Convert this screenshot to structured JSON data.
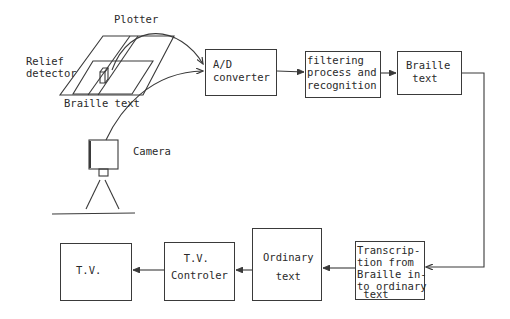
{
  "diagram": {
    "labels": {
      "plotter": "Plotter",
      "relief_detector_1": "Relief",
      "relief_detector_2": "detector",
      "braille_text_sheet": "Braille text",
      "camera": "Camera"
    },
    "nodes": [
      {
        "id": "ad",
        "lines": [
          "A/D",
          "converter"
        ]
      },
      {
        "id": "filter",
        "lines": [
          "filtering",
          "process and",
          "recognition"
        ]
      },
      {
        "id": "braille",
        "lines": [
          "Braille",
          " text"
        ]
      },
      {
        "id": "transcription",
        "lines": [
          "Transcrip-",
          "tion from",
          "Braille in-",
          "to ordinary",
          " text"
        ]
      },
      {
        "id": "ordinary",
        "lines": [
          "Ordinary",
          "  text"
        ]
      },
      {
        "id": "tvctrl",
        "lines": [
          "  T.V.",
          "Controler"
        ]
      },
      {
        "id": "tv",
        "lines": [
          "T.V."
        ]
      }
    ],
    "edges": [
      {
        "from": "plotter",
        "to": "ad"
      },
      {
        "from": "camera",
        "to": "ad"
      },
      {
        "from": "ad",
        "to": "filter"
      },
      {
        "from": "filter",
        "to": "braille"
      },
      {
        "from": "braille",
        "to": "transcription"
      },
      {
        "from": "transcription",
        "to": "ordinary"
      },
      {
        "from": "ordinary",
        "to": "tvctrl"
      },
      {
        "from": "tvctrl",
        "to": "tv"
      }
    ],
    "stroke_color": "#3a3a3a"
  }
}
